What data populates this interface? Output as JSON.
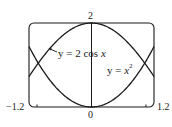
{
  "chart_data": {
    "type": "line",
    "title": "",
    "xlabel": "",
    "ylabel": "",
    "xlim": [
      -1.2,
      1.2
    ],
    "ylim": [
      0,
      2
    ],
    "grid": false,
    "legend": "none",
    "tick_labels": {
      "x_min": "−1.2",
      "x_max": "1.2",
      "x_center": "0",
      "y_top": "2"
    },
    "series": [
      {
        "name": "y = 2 cos x",
        "x": [
          -1.2,
          -1.0,
          -0.8,
          -0.6,
          -0.4,
          -0.2,
          0,
          0.2,
          0.4,
          0.6,
          0.8,
          1.0,
          1.2
        ],
        "values": [
          0.72,
          1.08,
          1.39,
          1.65,
          1.84,
          1.96,
          2.0,
          1.96,
          1.84,
          1.65,
          1.39,
          1.08,
          0.72
        ]
      },
      {
        "name": "y = x^2",
        "x": [
          -1.2,
          -1.0,
          -0.8,
          -0.6,
          -0.4,
          -0.2,
          0,
          0.2,
          0.4,
          0.6,
          0.8,
          1.0,
          1.2
        ],
        "values": [
          1.44,
          1.0,
          0.64,
          0.36,
          0.16,
          0.04,
          0.0,
          0.04,
          0.16,
          0.36,
          0.64,
          1.0,
          1.44
        ]
      }
    ],
    "annotations": [
      {
        "text": "y = 2 cos x",
        "target_series": "y = 2 cos x",
        "arrow": true
      },
      {
        "text": "y = x²",
        "target_series": "y = x^2",
        "arrow": false
      }
    ]
  },
  "labels": {
    "y_top": "2",
    "x_center": "0",
    "x_min": "−1.2",
    "x_max": "1.2",
    "cos_label_prefix": "y = 2 cos ",
    "cos_label_var": "x",
    "sq_label_prefix": "y = ",
    "sq_label_var": "x",
    "sq_label_exp": "2"
  },
  "style": {
    "stroke": "#1a1a1a",
    "background": "#ffffff"
  }
}
